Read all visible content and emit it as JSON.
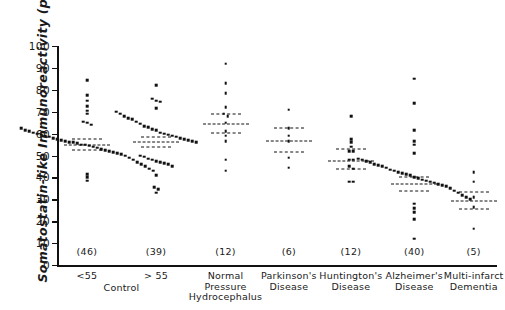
{
  "axes": {
    "ylabel": "Somatostatin-like Immunoreactivity  (pg/ml)",
    "ylim": [
      0,
      100
    ],
    "yticks": [
      0,
      10,
      20,
      30,
      40,
      50,
      60,
      70,
      80,
      90,
      100
    ],
    "ytick_labels": [
      "0",
      "10",
      "20",
      "30",
      "40",
      "50",
      "60",
      "70",
      "80",
      "90",
      "100"
    ],
    "control_group_label": "Control"
  },
  "chart_data": {
    "type": "scatter",
    "title": "",
    "xlabel": "",
    "ylabel": "Somatostatin-like Immunoreactivity (pg/ml)",
    "ylim": [
      0,
      100
    ],
    "grid": false,
    "legend": "none",
    "categories": [
      "< 55",
      "> 55",
      "Normal Pressure Hydrocephalus",
      "Parkinson's Disease",
      "Huntington's Disease",
      "Alzheimer's Disease",
      "Multi-infarct Dementia"
    ],
    "groups": [
      {
        "label_lines": [
          "<55"
        ],
        "n_label": "(46)",
        "n": 46,
        "mean": 55.0,
        "sem_upper": 57.5,
        "sem_lower": 52.5,
        "values": [
          84.5,
          77.5,
          75.0,
          72.5,
          70.5,
          69.0,
          65.5,
          65.0,
          64.0,
          62.5,
          61.5,
          61.0,
          60.5,
          60.0,
          59.5,
          59.0,
          58.5,
          58.0,
          57.5,
          57.0,
          56.5,
          56.0,
          56.0,
          55.5,
          55.0,
          55.0,
          54.5,
          54.0,
          53.5,
          53.0,
          52.5,
          52.0,
          51.5,
          51.0,
          50.5,
          50.0,
          49.0,
          48.0,
          47.0,
          46.0,
          45.0,
          44.0,
          43.0,
          41.5,
          40.0,
          38.5
        ]
      },
      {
        "label_lines": [
          "> 55"
        ],
        "n_label": "(39)",
        "n": 39,
        "mean": 56.0,
        "sem_upper": 58.5,
        "sem_lower": 54.0,
        "values": [
          82.0,
          76.0,
          75.0,
          74.5,
          71.5,
          70.0,
          69.0,
          68.0,
          67.0,
          66.5,
          65.5,
          64.5,
          63.5,
          63.0,
          62.0,
          61.5,
          60.5,
          60.0,
          59.5,
          59.0,
          58.5,
          58.0,
          57.5,
          57.0,
          56.5,
          56.0,
          50.0,
          49.5,
          48.5,
          48.0,
          47.5,
          47.0,
          46.5,
          46.0,
          45.0,
          41.0,
          35.5,
          34.5,
          33.0
        ]
      },
      {
        "label_lines": [
          "Normal",
          "Pressure",
          "Hydrocephalus"
        ],
        "n_label": "(12)",
        "n": 12,
        "mean": 64.5,
        "sem_upper": 69.0,
        "sem_lower": 60.5,
        "values": [
          92.0,
          83.0,
          78.5,
          72.0,
          69.0,
          68.0,
          65.0,
          61.0,
          59.0,
          56.5,
          48.0,
          43.0
        ]
      },
      {
        "label_lines": [
          "Parkinson's",
          "Disease"
        ],
        "n_label": "(6)",
        "n": 6,
        "mean": 56.5,
        "sem_upper": 62.5,
        "sem_lower": 51.5,
        "values": [
          71.0,
          62.5,
          59.0,
          56.5,
          49.0,
          44.5
        ]
      },
      {
        "label_lines": [
          "Huntington's",
          "Disease"
        ],
        "n_label": "(12)",
        "n": 12,
        "mean": 47.5,
        "sem_upper": 53.0,
        "sem_lower": 44.0,
        "values": [
          68.0,
          57.5,
          56.0,
          54.0,
          52.0,
          52.0,
          48.0,
          48.0,
          45.0,
          44.0,
          38.0,
          38.0
        ]
      },
      {
        "label_lines": [
          "Alzheimer's",
          "Disease"
        ],
        "n_label": "(40)",
        "n": 40,
        "mean": 37.0,
        "sem_upper": 40.0,
        "sem_lower": 34.0,
        "values": [
          85.0,
          74.0,
          61.5,
          56.5,
          55.0,
          51.0,
          48.5,
          48.0,
          47.5,
          47.0,
          46.0,
          45.5,
          45.0,
          44.5,
          43.5,
          43.0,
          42.5,
          42.0,
          41.5,
          41.0,
          40.0,
          39.5,
          39.0,
          38.5,
          38.0,
          37.5,
          37.0,
          36.5,
          36.0,
          35.0,
          34.0,
          33.0,
          32.0,
          31.0,
          30.0,
          28.0,
          26.0,
          24.0,
          21.0,
          12.0
        ]
      },
      {
        "label_lines": [
          "Multi-infarct",
          "Dementia"
        ],
        "n_label": "(5)",
        "n": 5,
        "mean": 29.0,
        "sem_upper": 33.5,
        "sem_lower": 25.5,
        "values": [
          42.5,
          38.0,
          31.0,
          26.5,
          16.5
        ]
      }
    ]
  }
}
